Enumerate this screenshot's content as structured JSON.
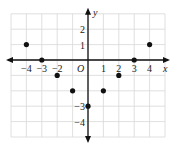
{
  "chart_data": {
    "type": "scatter",
    "title": "",
    "xlabel": "x",
    "ylabel": "y",
    "origin_label": "O",
    "xlim": [
      -5,
      5
    ],
    "ylim": [
      -5,
      3
    ],
    "grid": true,
    "x_ticks": [
      -4,
      -3,
      -2,
      1,
      2,
      3,
      4
    ],
    "y_ticks": [
      2,
      1,
      -3,
      -4
    ],
    "x_tick_labels": [
      "−4",
      "−3",
      "−2",
      "1",
      "2",
      "3",
      "4"
    ],
    "y_tick_labels": [
      "2",
      "1",
      "−3",
      "−4"
    ],
    "series": [
      {
        "name": "points",
        "x": [
          -4,
          -3,
          -2,
          -1,
          0,
          1,
          2,
          3,
          4
        ],
        "y": [
          1,
          0,
          -1,
          -2,
          -3,
          -2,
          -1,
          0,
          1
        ]
      }
    ],
    "colors": {
      "grid": "#d8d8d8",
      "axis": "#111111",
      "point": "#111111"
    }
  }
}
